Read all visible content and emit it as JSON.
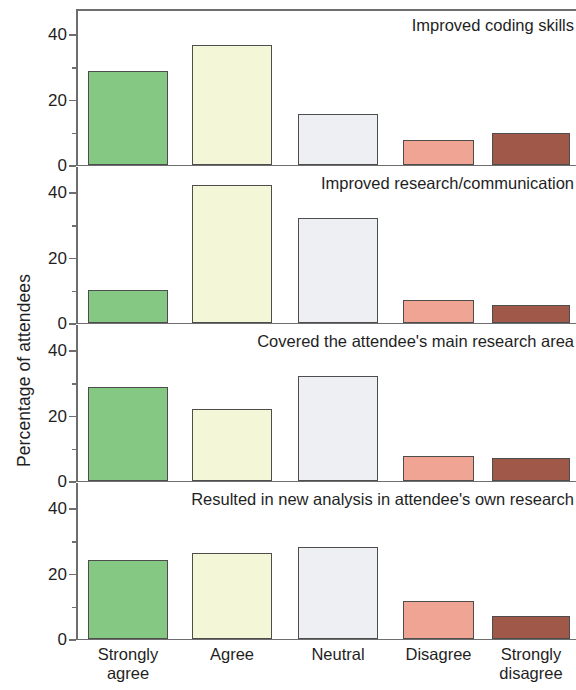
{
  "chart_data": {
    "type": "bar",
    "title": "",
    "xlabel": "",
    "ylabel": "Percentage of attendees",
    "categories": [
      "Strongly agree",
      "Agree",
      "Neutral",
      "Disagree",
      "Strongly disagree"
    ],
    "category_lines": [
      [
        "Strongly",
        "agree"
      ],
      [
        "Agree",
        ""
      ],
      [
        "Neutral",
        ""
      ],
      [
        "Disagree",
        ""
      ],
      [
        "Strongly",
        "disagree"
      ]
    ],
    "ylim": [
      0,
      48
    ],
    "yticks": [
      0,
      20,
      40
    ],
    "yticklabels": [
      "0",
      "20",
      "40"
    ],
    "yminorticks": [
      10,
      30
    ],
    "grid": false,
    "legend": "none",
    "panel_layout": "4 stacked panels sharing one x axis",
    "bar_colors": [
      "#84c884",
      "#f4f6d8",
      "#edeff2",
      "#f0a494",
      "#a05848"
    ],
    "bar_edge_color": "#4d4d4d",
    "axis_color": "#6e6e6e",
    "panels": [
      {
        "title": "Improved coding skills",
        "values": [
          28.5,
          36.5,
          15.5,
          7.5,
          9.5
        ]
      },
      {
        "title": "Improved research/communication",
        "values": [
          10,
          42,
          32,
          7,
          5.5
        ]
      },
      {
        "title": "Covered the attendee's main research area",
        "values": [
          28.5,
          22,
          32,
          7.5,
          7
        ]
      },
      {
        "title": "Resulted in new analysis in attendee's own research",
        "values": [
          24,
          26,
          28,
          11.5,
          7
        ]
      }
    ]
  }
}
